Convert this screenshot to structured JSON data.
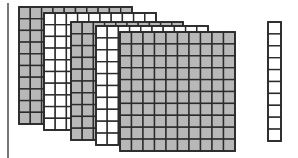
{
  "diagram": {
    "title": "",
    "colors": {
      "gray_fill": "#b8b8b8",
      "white_fill": "#ffffff",
      "stroke": "#2b2b2b",
      "divider": "#555555"
    },
    "flats": [
      {
        "id": "flat-1",
        "fill": "gray",
        "rows": 10,
        "cols": 10
      },
      {
        "id": "flat-2",
        "fill": "white",
        "rows": 10,
        "cols": 10
      },
      {
        "id": "flat-3",
        "fill": "gray",
        "rows": 10,
        "cols": 10
      },
      {
        "id": "flat-4",
        "fill": "white",
        "rows": 10,
        "cols": 10
      },
      {
        "id": "flat-5",
        "fill": "gray",
        "rows": 10,
        "cols": 10
      }
    ],
    "rods": [
      {
        "id": "rod-1",
        "fill": "white",
        "rows": 10,
        "cols": 1
      }
    ],
    "counts": {
      "hundreds": 5,
      "tens": 1,
      "ones": 0,
      "total": 510
    }
  }
}
